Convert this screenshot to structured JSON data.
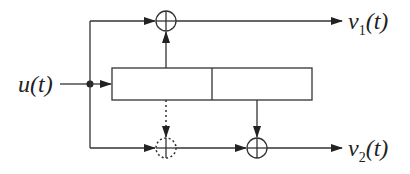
{
  "diagram": {
    "type": "block-diagram",
    "input": {
      "label": "u",
      "arg": "(t)"
    },
    "outputs": [
      {
        "label": "v",
        "sub": "1",
        "arg": "(t)"
      },
      {
        "label": "v",
        "sub": "2",
        "arg": "(t)"
      }
    ],
    "register": {
      "cells": 2
    },
    "adders": [
      {
        "id": "top-adder",
        "style": "solid",
        "output": "v1"
      },
      {
        "id": "bottom-left-adder",
        "style": "dotted",
        "output": "v2"
      },
      {
        "id": "bottom-right-adder",
        "style": "solid",
        "output": "v2"
      }
    ],
    "colors": {
      "stroke": "#333333",
      "background": "#ffffff"
    }
  }
}
